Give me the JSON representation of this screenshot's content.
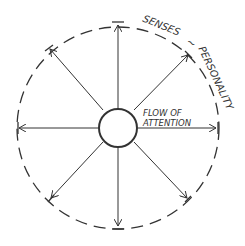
{
  "diagram": {
    "labels": {
      "senses": "SENSES",
      "tilde": "~",
      "personality": "PERSONALITY",
      "flow_line1": "FLOW OF",
      "flow_line2": "ATTENTION"
    },
    "colors": {
      "stroke": "#333333",
      "background": "#ffffff"
    },
    "arrows": [
      "up",
      "up-right",
      "right",
      "down-right",
      "down",
      "down-left",
      "left",
      "up-left"
    ]
  }
}
